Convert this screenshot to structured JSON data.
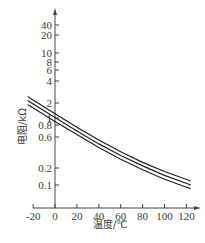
{
  "chart_data": {
    "type": "line",
    "title": "",
    "xlabel": "温度/℃",
    "ylabel": "电阻/kΩ",
    "yscale": "log",
    "xlim": [
      -20,
      125
    ],
    "ylim": [
      0.07,
      60
    ],
    "x_ticks": [
      "-20",
      "0",
      "20",
      "40",
      "60",
      "80",
      "100",
      "120"
    ],
    "y_ticks": [
      "40",
      "20",
      "10",
      "8",
      "6",
      "4",
      "2",
      "1",
      "0.8",
      "0.6",
      "0.2",
      "0.1"
    ],
    "grid": false,
    "legend": null,
    "series": [
      {
        "name": "upper",
        "x": [
          -20,
          0,
          20,
          40,
          60,
          80,
          100,
          120
        ],
        "values": [
          2.2,
          1.2,
          0.75,
          0.48,
          0.32,
          0.22,
          0.16,
          0.115
        ]
      },
      {
        "name": "middle",
        "x": [
          -20,
          0,
          20,
          40,
          60,
          80,
          100,
          120
        ],
        "values": [
          1.9,
          1.05,
          0.66,
          0.42,
          0.28,
          0.195,
          0.14,
          0.1
        ]
      },
      {
        "name": "lower",
        "x": [
          -20,
          0,
          20,
          40,
          60,
          80,
          100,
          120
        ],
        "values": [
          1.65,
          0.92,
          0.58,
          0.37,
          0.245,
          0.17,
          0.122,
          0.088
        ]
      }
    ]
  },
  "labels": {
    "x_axis": "温度/℃",
    "y_axis": "电阻/kΩ"
  }
}
